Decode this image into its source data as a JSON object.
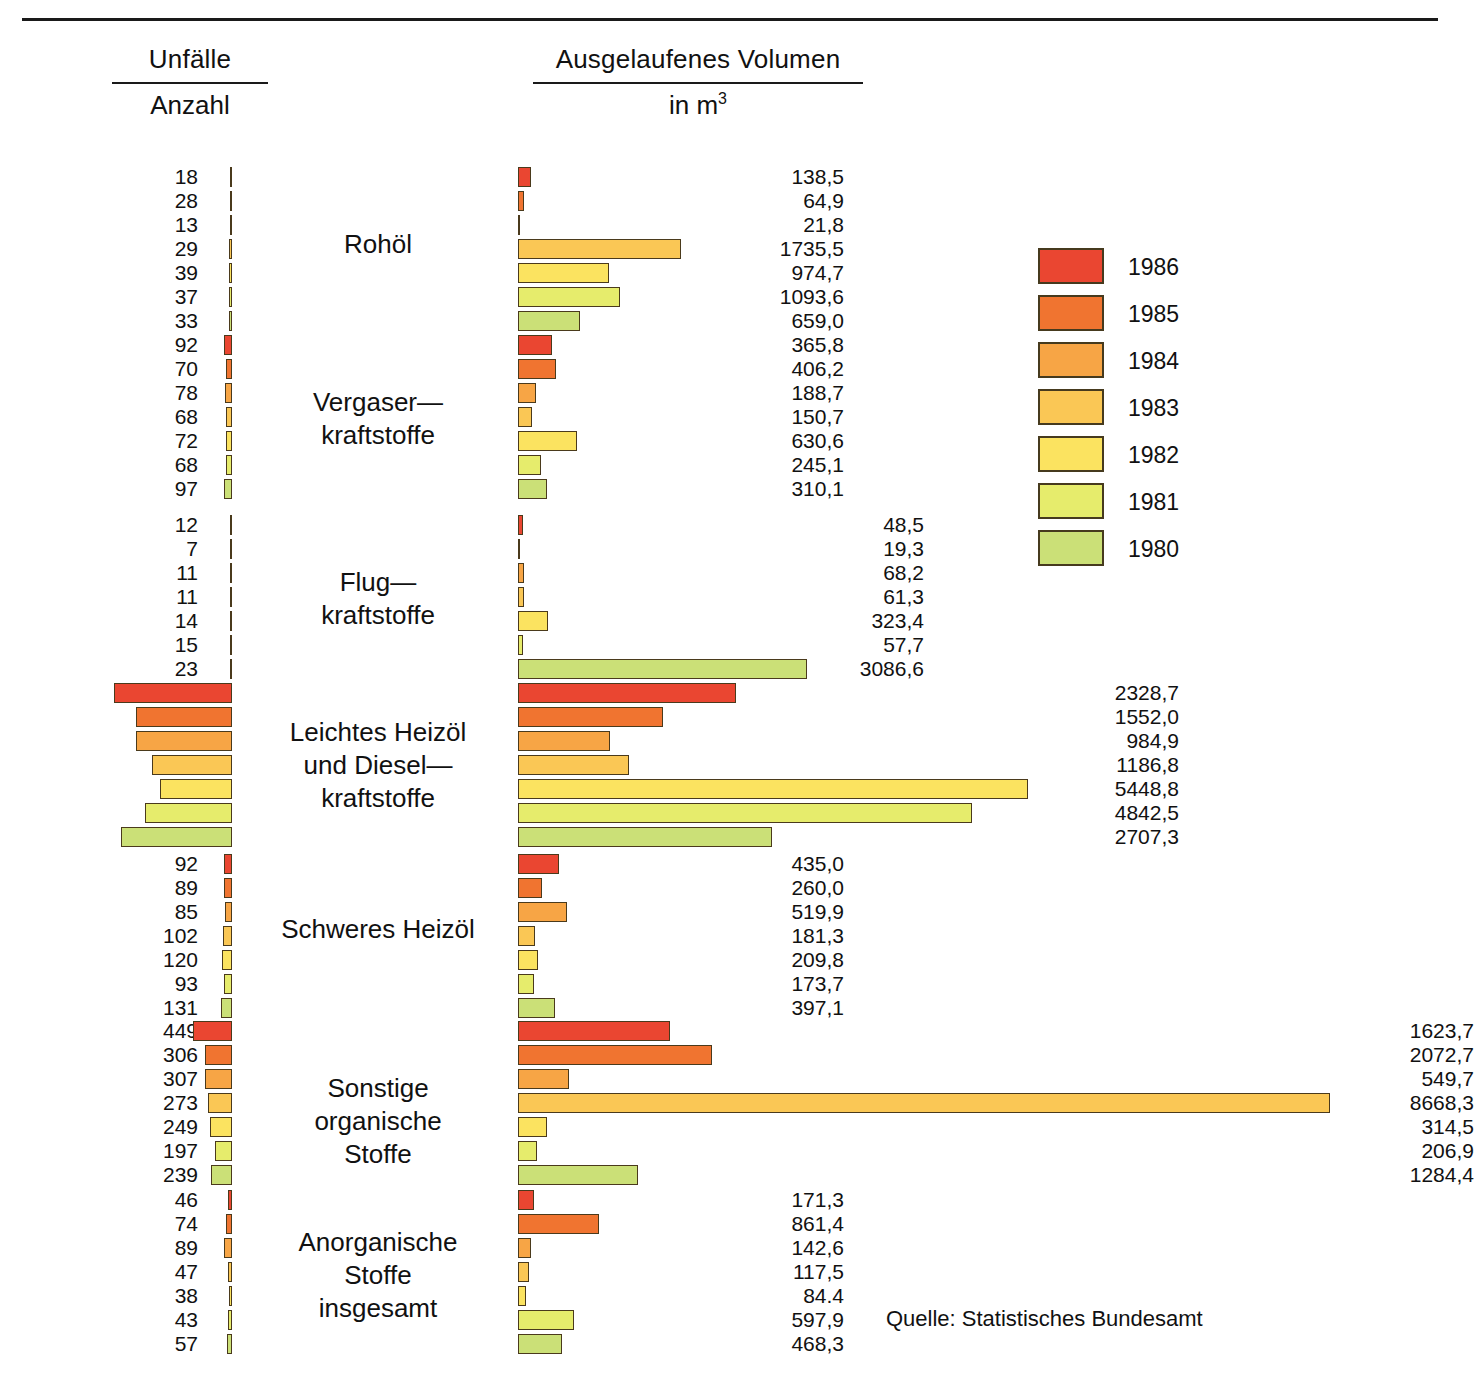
{
  "header": {
    "left_title": "Unfälle",
    "left_subtitle": "Anzahl",
    "right_title": "Ausgelaufenes Volumen",
    "right_subtitle_prefix": "in m",
    "right_subtitle_exponent": "3"
  },
  "source": "Quelle:  Statistisches Bundesamt",
  "legend": {
    "items": [
      {
        "year": "1986",
        "color": "#ea4631"
      },
      {
        "year": "1985",
        "color": "#f07430"
      },
      {
        "year": "1984",
        "color": "#f7a545"
      },
      {
        "year": "1983",
        "color": "#fac755"
      },
      {
        "year": "1982",
        "color": "#fbe360"
      },
      {
        "year": "1981",
        "color": "#e6ec6c"
      },
      {
        "year": "1980",
        "color": "#cbe077"
      }
    ]
  },
  "chart_data": {
    "type": "bar",
    "orientation": "horizontal",
    "panels": [
      {
        "name": "Unfälle",
        "unit": "Anzahl",
        "align": "right",
        "xlabel": "Anzahl"
      },
      {
        "name": "Ausgelaufenes Volumen",
        "unit": "m³",
        "align": "left",
        "xlabel": "in m3"
      }
    ],
    "series_key": "year",
    "series": [
      "1986",
      "1985",
      "1984",
      "1983",
      "1982",
      "1981",
      "1980"
    ],
    "colors": [
      "#ea4631",
      "#f07430",
      "#f7a545",
      "#fac755",
      "#fbe360",
      "#e6ec6c",
      "#cbe077"
    ],
    "categories": [
      "Rohöl",
      "Vergaserkraftstoffe",
      "Flugkraftstoffe",
      "Leichtes Heizöl und Dieselkraftstoffe",
      "Schweres Heizöl",
      "Sonstige organische Stoffe",
      "Anorganische Stoffe insgesamt"
    ],
    "groups": [
      {
        "label": "Rohöl",
        "label_lines": "Rohöl",
        "accidents": [
          18,
          28,
          13,
          29,
          39,
          37,
          33
        ],
        "accidents_text": [
          "18",
          "28",
          "13",
          "29",
          "39",
          "37",
          "33"
        ],
        "volume": [
          138.5,
          64.9,
          21.8,
          1735.5,
          974.7,
          1093.6,
          659.0
        ],
        "volume_text": [
          "138,5",
          "64,9",
          "21,8",
          "1735,5",
          "974,7",
          "1093,6",
          "659,0"
        ]
      },
      {
        "label": "Vergaserkraftstoffe",
        "label_lines": "Vergaser—\nkraftstoffe",
        "accidents": [
          92,
          70,
          78,
          68,
          72,
          68,
          97
        ],
        "accidents_text": [
          "92",
          "70",
          "78",
          "68",
          "72",
          "68",
          "97"
        ],
        "volume": [
          365.8,
          406.2,
          188.7,
          150.7,
          630.6,
          245.1,
          310.1
        ],
        "volume_text": [
          "365,8",
          "406,2",
          "188,7",
          "150,7",
          "630,6",
          "245,1",
          "310,1"
        ]
      },
      {
        "label": "Flugkraftstoffe",
        "label_lines": "Flug—\nkraftstoffe",
        "accidents": [
          12,
          7,
          11,
          11,
          14,
          15,
          23
        ],
        "accidents_text": [
          "12",
          "7",
          "11",
          "11",
          "14",
          "15",
          "23"
        ],
        "volume": [
          48.5,
          19.3,
          68.2,
          61.3,
          323.4,
          57.7,
          3086.6
        ],
        "volume_text": [
          "48,5",
          "19,3",
          "68,2",
          "61,3",
          "323,4",
          "57,7",
          "3086,6"
        ]
      },
      {
        "label": "Leichtes Heizöl und Dieselkraftstoffe",
        "label_lines": "Leichtes Heizöl\nund Diesel—\nkraftstoffe",
        "accidents": [
          1345,
          1095,
          1097,
          913,
          828,
          993,
          1267
        ],
        "accidents_text": [
          "1345",
          "1095",
          "1097",
          "913",
          "828",
          "993",
          "1267"
        ],
        "volume": [
          2328.7,
          1552.0,
          984.9,
          1186.8,
          5448.8,
          4842.5,
          2707.3
        ],
        "volume_text": [
          "2328,7",
          "1552,0",
          "984,9",
          "1186,8",
          "5448,8",
          "4842,5",
          "2707,3"
        ]
      },
      {
        "label": "Schweres Heizöl",
        "label_lines": "Schweres Heizöl",
        "accidents": [
          92,
          89,
          85,
          102,
          120,
          93,
          131
        ],
        "accidents_text": [
          "92",
          "89",
          "85",
          "102",
          "120",
          "93",
          "131"
        ],
        "volume": [
          435.0,
          260.0,
          519.9,
          181.3,
          209.8,
          173.7,
          397.1
        ],
        "volume_text": [
          "435,0",
          "260,0",
          "519,9",
          "181,3",
          "209,8",
          "173,7",
          "397,1"
        ]
      },
      {
        "label": "Sonstige organische Stoffe",
        "label_lines": "Sonstige\norganische\nStoffe",
        "accidents": [
          449,
          306,
          307,
          273,
          249,
          197,
          239
        ],
        "accidents_text": [
          "449",
          "306",
          "307",
          "273",
          "249",
          "197",
          "239"
        ],
        "volume": [
          1623.7,
          2072.7,
          549.7,
          8668.3,
          314.5,
          206.9,
          1284.4
        ],
        "volume_text": [
          "1623,7",
          "2072,7",
          "549,7",
          "8668,3",
          "314,5",
          "206,9",
          "1284,4"
        ]
      },
      {
        "label": "Anorganische Stoffe insgesamt",
        "label_lines": "Anorganische\nStoffe\ninsgesamt",
        "accidents": [
          46,
          74,
          89,
          47,
          38,
          43,
          57
        ],
        "accidents_text": [
          "46",
          "74",
          "89",
          "47",
          "38",
          "43",
          "57"
        ],
        "volume": [
          171.3,
          861.4,
          142.6,
          117.5,
          84.4,
          597.9,
          468.3
        ],
        "volume_text": [
          "171,3",
          "861,4",
          "142,6",
          "117,5",
          "84.4",
          "597,9",
          "468,3"
        ]
      }
    ]
  },
  "layout": {
    "group_tops": [
      165,
      333,
      513,
      681,
      852,
      1019,
      1188
    ],
    "row_height": 24,
    "accidents_right_edge": 232,
    "accidents_px_per_unit": 0.0875,
    "volume_left_edge": 518,
    "volume_px_per_unit": 0.09368,
    "volume_label_left": [
      714,
      714,
      794,
      1049,
      714,
      1344,
      714
    ],
    "category_tops": [
      228,
      386,
      566,
      716,
      913,
      1072,
      1226
    ]
  }
}
